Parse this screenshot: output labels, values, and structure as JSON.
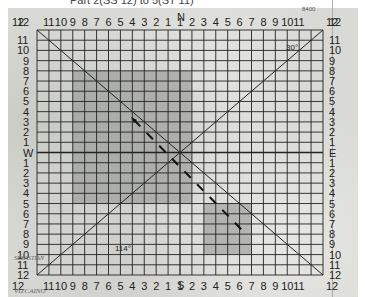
{
  "caption": "Part 2(SS 12) to 5(ST 11)",
  "grid": {
    "left": 37,
    "top": 30,
    "right": 323,
    "bottom": 275,
    "columns": 24,
    "rows": 24,
    "line_color": "#222222",
    "shade_color": "#8e8f8c"
  },
  "compass": {
    "north": "N",
    "south": "S",
    "west": "W",
    "east": "E"
  },
  "top_labels": [
    "12",
    "11",
    "10",
    "9",
    "8",
    "7",
    "6",
    "5",
    "4",
    "3",
    "2",
    "1",
    "1",
    "2",
    "3",
    "4",
    "5",
    "6",
    "7",
    "8",
    "9",
    "10",
    "11",
    "12"
  ],
  "bottom_labels": [
    "12",
    "11",
    "10",
    "9",
    "8",
    "7",
    "6",
    "5",
    "4",
    "3",
    "2",
    "1",
    "1",
    "2",
    "3",
    "4",
    "5",
    "6",
    "7",
    "8",
    "9",
    "10",
    "11",
    "12"
  ],
  "left_labels": [
    "12",
    "11",
    "10",
    "9",
    "8",
    "7",
    "6",
    "5",
    "4",
    "3",
    "2",
    "1",
    "W",
    "1",
    "2",
    "3",
    "4",
    "5",
    "6",
    "7",
    "8",
    "9",
    "10",
    "11",
    "12"
  ],
  "right_labels": [
    "12",
    "11",
    "10",
    "9",
    "8",
    "7",
    "6",
    "5",
    "4",
    "3",
    "2",
    "1",
    "E",
    "1",
    "2",
    "3",
    "4",
    "5",
    "6",
    "7",
    "8",
    "9",
    "10",
    "11",
    "12"
  ],
  "shaded_regions": [
    {
      "name": "region-upper-left",
      "col_start": 3,
      "col_end": 13,
      "row_start": 4,
      "row_end": 17
    },
    {
      "name": "region-lower-right",
      "col_start": 14,
      "col_end": 18,
      "row_start": 17,
      "row_end": 22
    }
  ],
  "annotations": {
    "lat_30": "30°",
    "lon_114": "114°",
    "elev_top": "8400",
    "place_vizcaino": "VIZCAINO",
    "place_sebastian": "SEBASTIAN"
  },
  "track": {
    "style": "dashed",
    "from": [
      134,
      120
    ],
    "to": [
      242,
      230
    ]
  }
}
